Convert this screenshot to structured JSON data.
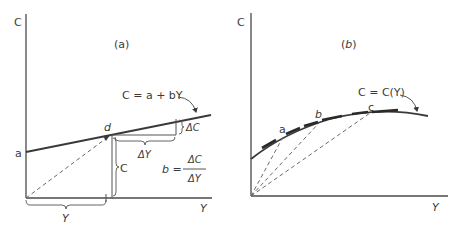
{
  "figure": {
    "panel_a": {
      "label": "(a)",
      "y_axis_label": "C",
      "x_axis_label": "Y",
      "intercept_label": "a",
      "point_label": "d",
      "equation": "C = a + bY",
      "delta_c_label": "ΔC",
      "delta_y_label": "ΔY",
      "c_brace_label": "C",
      "y_brace_label": "Y",
      "slope_lhs": "b =",
      "slope_num": "ΔC",
      "slope_den": "ΔY"
    },
    "panel_b": {
      "label": "(b)",
      "y_axis_label": "C",
      "x_axis_label": "Y",
      "equation": "C = C(Y)",
      "points": [
        {
          "label": "a"
        },
        {
          "label": "b"
        },
        {
          "label": "c"
        }
      ]
    }
  }
}
